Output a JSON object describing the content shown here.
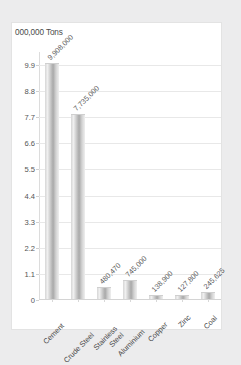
{
  "chart_data": {
    "type": "bar",
    "title": "000,000 Tons",
    "xlabel": "",
    "ylabel": "",
    "ylim": [
      0,
      10.45
    ],
    "grid": true,
    "legend": "none",
    "value_scale_note": "y-axis in millions of tons",
    "categories": [
      "Cement",
      "Crude Steel",
      "Stainless Steel",
      "Aluminium",
      "Copper",
      "Zinc",
      "Coal"
    ],
    "category_lines": [
      [
        "Cement"
      ],
      [
        "Crude Steel"
      ],
      [
        "Stainless",
        "Steel"
      ],
      [
        "Aluminium"
      ],
      [
        "Copper"
      ],
      [
        "Zinc"
      ],
      [
        "Coal"
      ]
    ],
    "values": [
      9908000,
      7735000,
      480470,
      745000,
      138900,
      127800,
      245625
    ],
    "data_labels": [
      "9,908,000",
      "7,735,000",
      "480,470",
      "745,000",
      "138,900",
      "127,800",
      "245,625"
    ],
    "ytick_labels": [
      "9.9",
      "8.8",
      "7.7",
      "6.6",
      "5.5",
      "4.4",
      "3.3",
      "2.2",
      "1.1",
      "0"
    ],
    "ytick_values": [
      9.9,
      8.8,
      7.7,
      6.6,
      5.5,
      4.4,
      3.3,
      2.2,
      1.1,
      0
    ]
  },
  "colors": {
    "page_background": "#ececed",
    "card_background": "#ffffff",
    "gridline": "#e8e8e8",
    "bar_light": "#efefef",
    "bar_dark": "#a9a9a9",
    "text": "#4a4a4a"
  }
}
